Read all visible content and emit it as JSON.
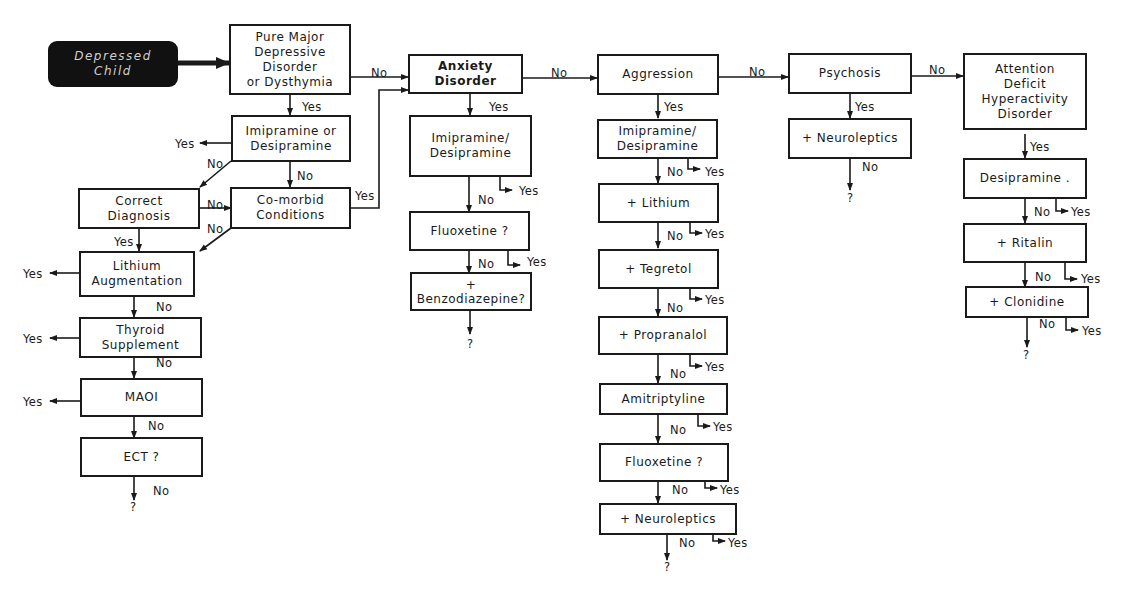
{
  "start": {
    "label": "Depressed\nChild"
  },
  "columns": {
    "main": {
      "pure_major": "Pure Major\nDepressive\nDisorder\nor Dysthymia",
      "imipramine_or_desipramine": "Imipramine or\nDesipramine",
      "correct_diagnosis": "Correct\nDiagnosis",
      "comorbid": "Co-morbid\nConditions",
      "lithium_aug": "Lithium\nAugmentation",
      "thyroid": "Thyroid\nSupplement",
      "maoi": "MAOI",
      "ect": "ECT ?"
    },
    "anxiety": {
      "anxiety_disorder": "Anxiety\nDisorder",
      "imipramine_desipramine": "Imipramine/\nDesipramine",
      "fluoxetine": "Fluoxetine ?",
      "benzodiazepine": "+\nBenzodiazepine?"
    },
    "aggression": {
      "aggression": "Aggression",
      "imipramine_desipramine": "Imipramine/\nDesipramine",
      "lithium": "+ Lithium",
      "tegretol": "+ Tegretol",
      "propranalol": "+ Propranalol",
      "amitriptyline": "Amitriptyline",
      "fluoxetine": "Fluoxetine ?",
      "neuroleptics": "+ Neuroleptics"
    },
    "psychosis": {
      "psychosis": "Psychosis",
      "neuroleptics": "+ Neuroleptics"
    },
    "adhd": {
      "adhd": "Attention\nDeficit\nHyperactivity\nDisorder",
      "desipramine": "Desipramine .",
      "ritalin": "+ Ritalin",
      "clonidine": "+ Clonidine"
    }
  },
  "labels": {
    "yes": "Yes",
    "no": "No",
    "unknown": "?"
  }
}
